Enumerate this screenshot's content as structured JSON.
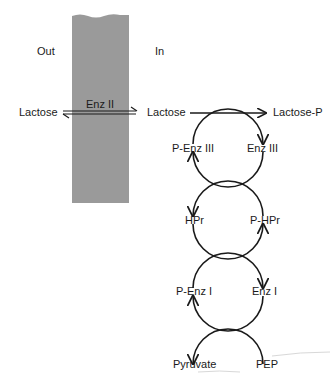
{
  "regions": {
    "outside": "Out",
    "inside": "In"
  },
  "membrane": {
    "enzyme": "Enz II",
    "color": "#9a9a9a"
  },
  "transport": {
    "substrate_out": "Lactose",
    "substrate_in": "Lactose",
    "product": "Lactose-P"
  },
  "cycles": [
    {
      "left": "P-Enz III",
      "right": "Enz III"
    },
    {
      "left": "HPr",
      "right": "P-HPr"
    },
    {
      "left": "P-Enz I",
      "right": "Enz I"
    },
    {
      "left": "Pyruvate",
      "right": "PEP"
    }
  ],
  "colors": {
    "line": "#1a1a1a",
    "background": "#ffffff"
  }
}
